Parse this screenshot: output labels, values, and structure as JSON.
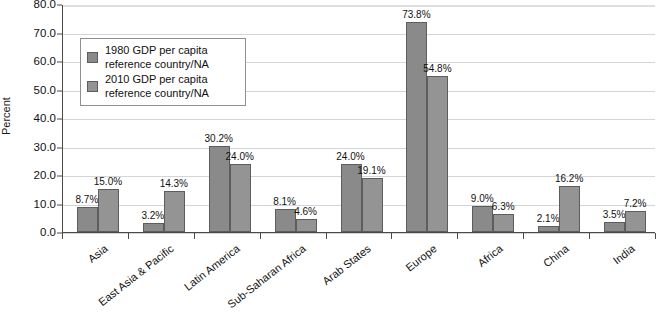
{
  "chart_data": {
    "type": "bar",
    "title": "",
    "xlabel": "",
    "ylabel": "Percent",
    "ylim": [
      0,
      80
    ],
    "ytick_step": 10,
    "grid": true,
    "legend_position": "upper-left-inside",
    "value_suffix": "%",
    "categories": [
      "Asia",
      "East Asia & Pacific",
      "Latin America",
      "Sub-Saharan Africa",
      "Arab States",
      "Europe",
      "Africa",
      "China",
      "India"
    ],
    "series": [
      {
        "name": "1980 GDP per capita reference country/NA",
        "values": [
          8.7,
          3.2,
          30.2,
          8.1,
          24.0,
          73.8,
          9.0,
          2.1,
          3.5
        ]
      },
      {
        "name": "2010 GDP per capita reference country/NA",
        "values": [
          15.0,
          14.3,
          24.0,
          4.6,
          19.1,
          54.8,
          6.3,
          16.2,
          7.2
        ]
      }
    ],
    "ytick_labels": [
      "0.0",
      "10.0",
      "20.0",
      "30.0",
      "40.0",
      "50.0",
      "60.0",
      "70.0",
      "80.0"
    ],
    "data_labels": [
      [
        "8.7%",
        "3.2%",
        "30.2%",
        "8.1%",
        "24.0%",
        "73.8%",
        "9.0%",
        "2.1%",
        "3.5%"
      ],
      [
        "15.0%",
        "14.3%",
        "24.0%",
        "4.6%",
        "19.1%",
        "54.8%",
        "6.3%",
        "16.2%",
        "7.2%"
      ]
    ],
    "colors": {
      "series_1980": "#8a8a8a",
      "series_2010": "#949494",
      "bar_border": "#5d5d5d",
      "gridline": "#d2d6da",
      "axis": "#4a4a4a",
      "text": "#111111",
      "background": "#ffffff"
    }
  },
  "legend": {
    "items": [
      {
        "label": "1980 GDP per capita\nreference country/NA"
      },
      {
        "label": "2010 GDP per capita\nreference country/NA"
      }
    ]
  },
  "axes": {
    "y_title": "Percent"
  }
}
